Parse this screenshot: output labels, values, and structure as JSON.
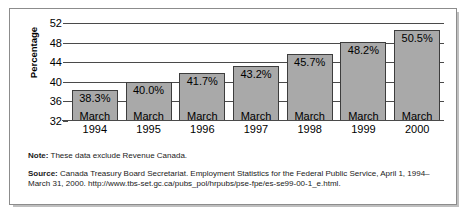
{
  "chart_data": {
    "type": "bar",
    "title": "",
    "xlabel": "",
    "ylabel": "Percentage",
    "categories": [
      "March\n1994",
      "March\n1995",
      "March\n1996",
      "March\n1997",
      "March\n1998",
      "March\n1999",
      "March\n2000"
    ],
    "category_lines": [
      [
        "March",
        "1994"
      ],
      [
        "March",
        "1995"
      ],
      [
        "March",
        "1996"
      ],
      [
        "March",
        "1997"
      ],
      [
        "March",
        "1998"
      ],
      [
        "March",
        "1999"
      ],
      [
        "March",
        "2000"
      ]
    ],
    "values": [
      38.3,
      40.0,
      41.7,
      43.2,
      45.7,
      48.2,
      50.5
    ],
    "value_labels": [
      "38.3%",
      "40.0%",
      "41.7%",
      "43.2%",
      "45.7%",
      "48.2%",
      "50.5%"
    ],
    "ylim": [
      32,
      52
    ],
    "yticks": [
      32,
      36,
      40,
      44,
      48,
      52
    ],
    "ytick_labels": [
      "32",
      "36",
      "40",
      "44",
      "48",
      "52"
    ],
    "grid": true,
    "legend": "none",
    "bar_color": "#a9a9a9",
    "bar_border_color": "#3d3d3d"
  },
  "notes": {
    "note_key": "Note:",
    "note_text": "These data exclude Revenue Canada.",
    "source_key": "Source:",
    "source_text": "Canada Treasury Board Secretariat. Employment Statistics for the Federal Public Service, April 1, 1994–March 31, 2000. http://www.tbs-set.gc.ca/pubs_pol/hrpubs/pse-fpe/es-se99-00-1_e.html."
  }
}
